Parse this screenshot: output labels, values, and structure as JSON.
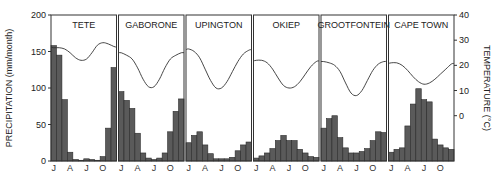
{
  "chart_data": {
    "type": "bar",
    "title": "",
    "xlabel": "",
    "ylabel": "PRECIPITATION (mm/month)",
    "y2label": "TEMPERATURE (°C)",
    "ylim": [
      0,
      200
    ],
    "y2lim": [
      -18,
      40
    ],
    "yticks": [
      0,
      50,
      100,
      150,
      200
    ],
    "y2ticks": [
      0,
      10,
      20,
      30,
      40
    ],
    "month_tick_labels": [
      "J",
      "A",
      "J",
      "O"
    ],
    "month_tick_indices": [
      0,
      3,
      6,
      9
    ],
    "categories": [
      "J",
      "F",
      "M",
      "A",
      "M",
      "J",
      "J",
      "A",
      "S",
      "O",
      "N",
      "D"
    ],
    "grid": false,
    "legend": null,
    "panels": [
      {
        "name": "TETE",
        "precipitation": [
          158,
          145,
          84,
          12,
          2,
          1,
          3,
          2,
          1,
          6,
          45,
          128
        ],
        "temperature": [
          27,
          27,
          26.5,
          25,
          23,
          22,
          22.5,
          25,
          28,
          29,
          28.5,
          27.5
        ]
      },
      {
        "name": "GABORONE",
        "precipitation": [
          95,
          83,
          72,
          38,
          11,
          4,
          2,
          4,
          11,
          40,
          68,
          85
        ],
        "temperature": [
          25,
          24,
          22.5,
          19,
          14.5,
          11.5,
          11.5,
          14.5,
          19,
          22.5,
          24,
          25
        ]
      },
      {
        "name": "UPINGTON",
        "precipitation": [
          25,
          35,
          40,
          22,
          10,
          3,
          3,
          3,
          5,
          14,
          22,
          26
        ],
        "temperature": [
          26.5,
          25.5,
          23,
          18.5,
          14,
          11,
          11,
          13.5,
          17.5,
          21.5,
          24.5,
          26
        ]
      },
      {
        "name": "OKIEP",
        "precipitation": [
          4,
          7,
          11,
          17,
          28,
          35,
          28,
          28,
          16,
          11,
          6,
          5
        ],
        "temperature": [
          22,
          22,
          21,
          18.5,
          15,
          12,
          11,
          11.5,
          13.5,
          16.5,
          19.5,
          21.5
        ]
      },
      {
        "name": "GROOTFONTEIN",
        "precipitation": [
          45,
          58,
          62,
          32,
          18,
          11,
          11,
          13,
          17,
          28,
          40,
          39
        ],
        "temperature": [
          21.5,
          21,
          20,
          17.5,
          13,
          9,
          8,
          10,
          14,
          18,
          20.5,
          21.5
        ]
      },
      {
        "name": "CAPE TOWN",
        "precipitation": [
          12,
          16,
          18,
          48,
          78,
          99,
          84,
          81,
          30,
          22,
          18,
          16
        ],
        "temperature": [
          21,
          21,
          20,
          18,
          15.5,
          13.5,
          12.5,
          13,
          14.5,
          16.5,
          18.5,
          20.5
        ]
      }
    ]
  },
  "colors": {
    "bar_fill": "#5a5a5a",
    "bar_stroke": "#2a2a2a",
    "frame": "#333333",
    "curve": "#333333"
  }
}
